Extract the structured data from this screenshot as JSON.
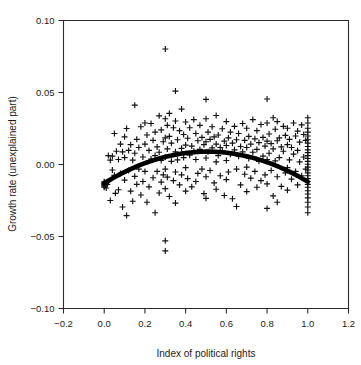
{
  "figure": {
    "background_color": "#ffffff",
    "foreground_color": "#1a1a1a"
  },
  "chart_data": {
    "type": "scatter",
    "title": "",
    "subtitle": "",
    "xlabel": "Index of political rights",
    "ylabel": "Growth rate (unexplained part)",
    "xlim": [
      -0.2,
      1.2
    ],
    "ylim": [
      -0.1,
      0.1
    ],
    "xticks": [
      -0.2,
      0.0,
      0.2,
      0.4,
      0.6,
      0.8,
      1.0,
      1.2
    ],
    "xticklabels": [
      "-0.2",
      "0.0",
      "0.2",
      "0.4",
      "0.6",
      "0.8",
      "1.0",
      "1.2"
    ],
    "yticks": [
      -0.1,
      -0.05,
      0.0,
      0.05,
      0.1
    ],
    "yticklabels": [
      "-0.10",
      "-0.05",
      "0.00",
      "0.05",
      "0.10"
    ],
    "grid": false,
    "legend": "none",
    "marker": "plus",
    "marker_color": "#111111",
    "marker_size": 5,
    "fit": {
      "type": "quadratic",
      "description": "Fitted inverted-U (quadratic) regression line",
      "color": "#000000",
      "line_width": 4.6,
      "coefficients": {
        "a": -0.0855,
        "b": 0.0866,
        "c": -0.013
      },
      "x_start": 0.0,
      "x_end": 1.0,
      "y_at_x0": -0.013,
      "y_peak": 0.0089,
      "x_peak": 0.506,
      "y_at_x1": -0.0119
    },
    "points": [
      [
        0.0,
        -0.0135
      ],
      [
        0.0,
        -0.0142
      ],
      [
        0.0,
        -0.0128
      ],
      [
        0.0,
        -0.015
      ],
      [
        0.0,
        -0.012
      ],
      [
        0.0,
        -0.0158
      ],
      [
        0.005,
        -0.0132
      ],
      [
        0.005,
        -0.0145
      ],
      [
        0.01,
        -0.0125
      ],
      [
        0.01,
        -0.0163
      ],
      [
        0.015,
        -0.0138
      ],
      [
        0.02,
        -0.0118
      ],
      [
        0.02,
        0.0062
      ],
      [
        0.03,
        0.003
      ],
      [
        0.03,
        -0.025
      ],
      [
        0.04,
        0.0058
      ],
      [
        0.04,
        -0.0038
      ],
      [
        0.05,
        0.0215
      ],
      [
        0.05,
        -0.0075
      ],
      [
        0.055,
        -0.02
      ],
      [
        0.06,
        0.0092
      ],
      [
        0.07,
        0.0035
      ],
      [
        0.07,
        -0.0175
      ],
      [
        0.08,
        0.0142
      ],
      [
        0.08,
        -0.0062
      ],
      [
        0.09,
        0.0088
      ],
      [
        0.09,
        -0.0295
      ],
      [
        0.1,
        0.0192
      ],
      [
        0.1,
        0.0048
      ],
      [
        0.1,
        -0.0108
      ],
      [
        0.11,
        0.025
      ],
      [
        0.11,
        -0.0355
      ],
      [
        0.12,
        0.0098
      ],
      [
        0.12,
        -0.0042
      ],
      [
        0.13,
        0.0138
      ],
      [
        0.13,
        -0.0185
      ],
      [
        0.14,
        0.003
      ],
      [
        0.14,
        -0.0255
      ],
      [
        0.15,
        0.0412
      ],
      [
        0.15,
        0.0078
      ],
      [
        0.15,
        -0.0082
      ],
      [
        0.16,
        0.0175
      ],
      [
        0.16,
        -0.0138
      ],
      [
        0.17,
        0.0118
      ],
      [
        0.17,
        -0.0032
      ],
      [
        0.18,
        0.0262
      ],
      [
        0.18,
        -0.0212
      ],
      [
        0.19,
        0.0052
      ],
      [
        0.19,
        -0.0118
      ],
      [
        0.2,
        0.0288
      ],
      [
        0.2,
        0.0142
      ],
      [
        0.2,
        -0.0048
      ],
      [
        0.21,
        0.0205
      ],
      [
        0.21,
        -0.0262
      ],
      [
        0.22,
        0.0098
      ],
      [
        0.22,
        -0.0155
      ],
      [
        0.23,
        0.0285
      ],
      [
        0.23,
        0.0038
      ],
      [
        0.24,
        0.0168
      ],
      [
        0.24,
        -0.0092
      ],
      [
        0.25,
        0.0225
      ],
      [
        0.25,
        0.0062
      ],
      [
        0.25,
        -0.0335
      ],
      [
        0.26,
        0.0122
      ],
      [
        0.26,
        -0.0048
      ],
      [
        0.27,
        0.0338
      ],
      [
        0.27,
        0.0085
      ],
      [
        0.27,
        -0.0198
      ],
      [
        0.28,
        0.024
      ],
      [
        0.28,
        0.0028
      ],
      [
        0.28,
        -0.0122
      ],
      [
        0.29,
        0.0158
      ],
      [
        0.29,
        -0.0072
      ],
      [
        0.3,
        0.0802
      ],
      [
        0.3,
        0.0318
      ],
      [
        0.3,
        0.0185
      ],
      [
        0.3,
        0.0052
      ],
      [
        0.3,
        -0.0032
      ],
      [
        0.3,
        -0.0168
      ],
      [
        0.3,
        -0.053
      ],
      [
        0.3,
        -0.06
      ],
      [
        0.31,
        0.0272
      ],
      [
        0.31,
        0.0108
      ],
      [
        0.31,
        -0.0088
      ],
      [
        0.32,
        0.0355
      ],
      [
        0.32,
        0.0195
      ],
      [
        0.32,
        -0.0222
      ],
      [
        0.33,
        0.0148
      ],
      [
        0.33,
        0.0022
      ],
      [
        0.34,
        0.0255
      ],
      [
        0.34,
        -0.0112
      ],
      [
        0.35,
        0.051
      ],
      [
        0.35,
        0.0302
      ],
      [
        0.35,
        0.0088
      ],
      [
        0.35,
        -0.0052
      ],
      [
        0.35,
        -0.0268
      ],
      [
        0.36,
        0.0172
      ],
      [
        0.36,
        0.0032
      ],
      [
        0.37,
        0.0235
      ],
      [
        0.37,
        -0.0142
      ],
      [
        0.38,
        0.0385
      ],
      [
        0.38,
        0.0112
      ],
      [
        0.38,
        -0.0072
      ],
      [
        0.39,
        0.0208
      ],
      [
        0.39,
        0.0048
      ],
      [
        0.4,
        0.0295
      ],
      [
        0.4,
        0.0135
      ],
      [
        0.4,
        -0.0022
      ],
      [
        0.4,
        -0.0185
      ],
      [
        0.41,
        0.0182
      ],
      [
        0.41,
        -0.0098
      ],
      [
        0.42,
        0.0255
      ],
      [
        0.42,
        0.0065
      ],
      [
        0.43,
        0.0128
      ],
      [
        0.43,
        -0.0155
      ],
      [
        0.44,
        0.0312
      ],
      [
        0.44,
        0.0092
      ],
      [
        0.45,
        0.0215
      ],
      [
        0.45,
        0.0035
      ],
      [
        0.45,
        -0.0118
      ],
      [
        0.46,
        0.0165
      ],
      [
        0.46,
        -0.0062
      ],
      [
        0.47,
        0.0272
      ],
      [
        0.47,
        0.0105
      ],
      [
        0.48,
        0.0188
      ],
      [
        0.48,
        -0.0032
      ],
      [
        0.49,
        0.0138
      ],
      [
        0.49,
        -0.0202
      ],
      [
        0.5,
        0.0452
      ],
      [
        0.5,
        0.0318
      ],
      [
        0.5,
        0.0158
      ],
      [
        0.5,
        0.0045
      ],
      [
        0.5,
        -0.0085
      ],
      [
        0.5,
        -0.0235
      ],
      [
        0.51,
        0.0225
      ],
      [
        0.51,
        0.0088
      ],
      [
        0.52,
        0.0175
      ],
      [
        0.52,
        -0.0042
      ],
      [
        0.53,
        0.0262
      ],
      [
        0.53,
        0.0115
      ],
      [
        0.54,
        0.0192
      ],
      [
        0.54,
        -0.0128
      ],
      [
        0.55,
        0.034
      ],
      [
        0.55,
        0.0142
      ],
      [
        0.55,
        0.0018
      ],
      [
        0.55,
        -0.0172
      ],
      [
        0.56,
        0.0205
      ],
      [
        0.56,
        0.0062
      ],
      [
        0.57,
        0.0118
      ],
      [
        0.57,
        -0.0078
      ],
      [
        0.58,
        0.0248
      ],
      [
        0.58,
        0.0095
      ],
      [
        0.59,
        0.0162
      ],
      [
        0.59,
        -0.0215
      ],
      [
        0.6,
        0.0298
      ],
      [
        0.6,
        0.0132
      ],
      [
        0.6,
        0.0028
      ],
      [
        0.6,
        -0.0105
      ],
      [
        0.61,
        0.0185
      ],
      [
        0.61,
        -0.0052
      ],
      [
        0.62,
        0.0225
      ],
      [
        0.62,
        0.0072
      ],
      [
        0.63,
        0.0148
      ],
      [
        0.63,
        -0.0238
      ],
      [
        0.64,
        0.0265
      ],
      [
        0.64,
        0.0102
      ],
      [
        0.65,
        0.0172
      ],
      [
        0.65,
        -0.0032
      ],
      [
        0.65,
        -0.0292
      ],
      [
        0.66,
        0.0215
      ],
      [
        0.66,
        0.0058
      ],
      [
        0.67,
        0.0125
      ],
      [
        0.67,
        -0.0142
      ],
      [
        0.68,
        0.0285
      ],
      [
        0.68,
        0.0088
      ],
      [
        0.69,
        0.0168
      ],
      [
        0.69,
        -0.0068
      ],
      [
        0.7,
        0.0252
      ],
      [
        0.7,
        0.0118
      ],
      [
        0.7,
        -0.0018
      ],
      [
        0.7,
        -0.0188
      ],
      [
        0.71,
        0.0195
      ],
      [
        0.71,
        0.0042
      ],
      [
        0.72,
        0.0142
      ],
      [
        0.72,
        -0.0095
      ],
      [
        0.73,
        0.0312
      ],
      [
        0.73,
        0.0085
      ],
      [
        0.74,
        0.0178
      ],
      [
        0.74,
        -0.0048
      ],
      [
        0.75,
        0.0235
      ],
      [
        0.75,
        0.0105
      ],
      [
        0.75,
        -0.0158
      ],
      [
        0.76,
        0.0152
      ],
      [
        0.76,
        0.0022
      ],
      [
        0.77,
        0.0278
      ],
      [
        0.77,
        -0.0112
      ],
      [
        0.78,
        0.0188
      ],
      [
        0.78,
        0.0058
      ],
      [
        0.79,
        0.0128
      ],
      [
        0.79,
        -0.0072
      ],
      [
        0.8,
        0.0455
      ],
      [
        0.8,
        0.0288
      ],
      [
        0.8,
        0.0162
      ],
      [
        0.8,
        0.0035
      ],
      [
        0.8,
        -0.0135
      ],
      [
        0.8,
        -0.0305
      ],
      [
        0.81,
        0.0212
      ],
      [
        0.81,
        0.0078
      ],
      [
        0.82,
        0.0145
      ],
      [
        0.82,
        -0.0042
      ],
      [
        0.83,
        0.0325
      ],
      [
        0.83,
        0.0108
      ],
      [
        0.83,
        -0.0218
      ],
      [
        0.84,
        0.0245
      ],
      [
        0.84,
        0.0025
      ],
      [
        0.85,
        0.0298
      ],
      [
        0.85,
        0.0165
      ],
      [
        0.85,
        -0.0085
      ],
      [
        0.85,
        -0.0262
      ],
      [
        0.86,
        0.0185
      ],
      [
        0.86,
        0.0048
      ],
      [
        0.87,
        0.0122
      ],
      [
        0.87,
        -0.0152
      ],
      [
        0.88,
        0.0265
      ],
      [
        0.88,
        0.0092
      ],
      [
        0.89,
        0.0202
      ],
      [
        0.89,
        -0.0058
      ],
      [
        0.9,
        0.0252
      ],
      [
        0.9,
        0.0138
      ],
      [
        0.9,
        -0.0022
      ],
      [
        0.9,
        -0.0178
      ],
      [
        0.91,
        0.0175
      ],
      [
        0.91,
        0.0032
      ],
      [
        0.92,
        0.0118
      ],
      [
        0.92,
        -0.0102
      ],
      [
        0.93,
        0.0288
      ],
      [
        0.93,
        0.0072
      ],
      [
        0.94,
        0.0198
      ],
      [
        0.94,
        -0.0048
      ],
      [
        0.95,
        0.0232
      ],
      [
        0.95,
        0.0098
      ],
      [
        0.95,
        -0.0142
      ],
      [
        0.96,
        0.0155
      ],
      [
        0.96,
        0.0018
      ],
      [
        0.97,
        0.0275
      ],
      [
        0.97,
        -0.0078
      ],
      [
        0.98,
        0.0208
      ],
      [
        0.98,
        0.0052
      ],
      [
        0.99,
        0.0168
      ],
      [
        0.99,
        -0.0032
      ],
      [
        1.0,
        0.0325
      ],
      [
        1.0,
        0.0288
      ],
      [
        1.0,
        0.0252
      ],
      [
        1.0,
        0.0225
      ],
      [
        1.0,
        0.0198
      ],
      [
        1.0,
        0.0172
      ],
      [
        1.0,
        0.0148
      ],
      [
        1.0,
        0.0125
      ],
      [
        1.0,
        0.0102
      ],
      [
        1.0,
        0.0082
      ],
      [
        1.0,
        0.0062
      ],
      [
        1.0,
        0.0042
      ],
      [
        1.0,
        0.0022
      ],
      [
        1.0,
        0.0002
      ],
      [
        1.0,
        -0.0018
      ],
      [
        1.0,
        -0.0038
      ],
      [
        1.0,
        -0.0058
      ],
      [
        1.0,
        -0.0078
      ],
      [
        1.0,
        -0.0098
      ],
      [
        1.0,
        -0.0118
      ],
      [
        1.0,
        -0.0138
      ],
      [
        1.0,
        -0.0158
      ],
      [
        1.0,
        -0.0182
      ],
      [
        1.0,
        -0.0205
      ],
      [
        1.0,
        -0.0232
      ],
      [
        1.0,
        -0.0262
      ],
      [
        1.0,
        -0.0295
      ],
      [
        1.0,
        -0.0335
      ]
    ]
  }
}
